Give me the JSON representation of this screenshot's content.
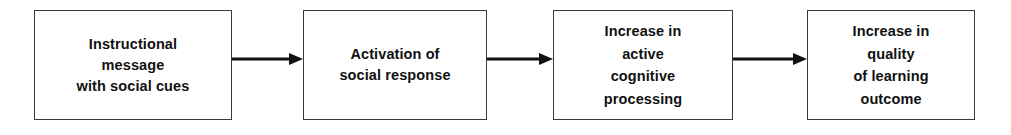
{
  "diagram": {
    "type": "flowchart",
    "orientation": "left-to-right",
    "title": "",
    "background_color": "#ffffff",
    "box_border_color": "#3b3b3b",
    "text_color": "#111111",
    "arrow_color": "#111111",
    "nodes": [
      {
        "id": "node-1",
        "label": "Instructional\nmessage\nwith social cues",
        "lines": [
          "Instructional",
          "message",
          "with social cues"
        ],
        "line_count": 3
      },
      {
        "id": "node-2",
        "label": "Activation of\nsocial response",
        "lines": [
          "Activation of",
          "social response"
        ],
        "line_count": 2
      },
      {
        "id": "node-3",
        "label": "Increase in\nactive\ncognitive\nprocessing",
        "lines": [
          "Increase in",
          "active",
          "cognitive",
          "processing"
        ],
        "line_count": 4
      },
      {
        "id": "node-4",
        "label": "Increase in\nquality\nof learning\noutcome",
        "lines": [
          "Increase in",
          "quality",
          "of learning",
          "outcome"
        ],
        "line_count": 4
      }
    ],
    "connectors": [
      {
        "id": "arrow-1",
        "from": "node-1",
        "to": "node-2",
        "glyph": "arrow-right-icon"
      },
      {
        "id": "arrow-2",
        "from": "node-2",
        "to": "node-3",
        "glyph": "arrow-right-icon"
      },
      {
        "id": "arrow-3",
        "from": "node-3",
        "to": "node-4",
        "glyph": "arrow-right-icon"
      }
    ]
  }
}
